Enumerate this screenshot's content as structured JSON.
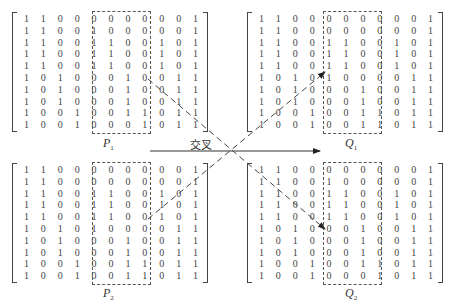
{
  "diagram": {
    "crossover_label": "交叉",
    "matrices": [
      {
        "id": "P1",
        "label": "P",
        "sub": "1",
        "rows": [
          [
            1,
            1,
            0,
            0,
            0,
            0,
            0,
            0,
            0,
            0,
            1
          ],
          [
            1,
            1,
            0,
            0,
            1,
            0,
            0,
            0,
            0,
            0,
            1
          ],
          [
            1,
            1,
            0,
            0,
            1,
            1,
            0,
            0,
            1,
            0,
            1
          ],
          [
            1,
            1,
            0,
            0,
            1,
            1,
            0,
            0,
            1,
            0,
            1
          ],
          [
            1,
            1,
            0,
            0,
            1,
            1,
            0,
            0,
            1,
            0,
            1
          ],
          [
            1,
            0,
            1,
            0,
            0,
            0,
            1,
            0,
            0,
            1,
            1
          ],
          [
            1,
            0,
            1,
            0,
            0,
            0,
            1,
            0,
            0,
            1,
            1
          ],
          [
            1,
            0,
            1,
            0,
            0,
            0,
            1,
            0,
            0,
            1,
            1
          ],
          [
            1,
            0,
            0,
            1,
            0,
            0,
            1,
            1,
            0,
            1,
            1
          ],
          [
            1,
            0,
            0,
            1,
            0,
            0,
            0,
            1,
            0,
            1,
            1
          ]
        ]
      },
      {
        "id": "Q1",
        "label": "Q",
        "sub": "1",
        "rows": [
          [
            1,
            1,
            0,
            0,
            0,
            0,
            0,
            0,
            0,
            0,
            1
          ],
          [
            1,
            1,
            0,
            0,
            0,
            0,
            0,
            0,
            0,
            0,
            1
          ],
          [
            1,
            1,
            0,
            0,
            1,
            1,
            0,
            0,
            1,
            0,
            1
          ],
          [
            1,
            1,
            0,
            0,
            1,
            1,
            0,
            0,
            1,
            0,
            1
          ],
          [
            1,
            1,
            0,
            0,
            1,
            1,
            0,
            0,
            1,
            0,
            1
          ],
          [
            1,
            0,
            1,
            0,
            1,
            0,
            0,
            0,
            0,
            1,
            1
          ],
          [
            1,
            0,
            1,
            0,
            0,
            0,
            1,
            0,
            0,
            1,
            1
          ],
          [
            1,
            0,
            1,
            0,
            0,
            0,
            1,
            0,
            0,
            1,
            1
          ],
          [
            1,
            0,
            0,
            1,
            0,
            0,
            1,
            1,
            0,
            1,
            1
          ],
          [
            1,
            0,
            0,
            1,
            0,
            0,
            1,
            1,
            0,
            1,
            1
          ]
        ]
      },
      {
        "id": "P2",
        "label": "P",
        "sub": "2",
        "rows": [
          [
            1,
            1,
            0,
            0,
            0,
            0,
            0,
            0,
            0,
            0,
            1
          ],
          [
            1,
            1,
            0,
            0,
            0,
            0,
            0,
            0,
            0,
            0,
            1
          ],
          [
            1,
            1,
            0,
            0,
            1,
            1,
            0,
            0,
            1,
            0,
            1
          ],
          [
            1,
            1,
            0,
            0,
            1,
            1,
            0,
            0,
            1,
            0,
            1
          ],
          [
            1,
            1,
            0,
            0,
            1,
            1,
            0,
            0,
            1,
            0,
            1
          ],
          [
            1,
            0,
            1,
            0,
            1,
            0,
            0,
            0,
            0,
            1,
            1
          ],
          [
            1,
            0,
            1,
            0,
            0,
            0,
            1,
            0,
            0,
            1,
            1
          ],
          [
            1,
            0,
            1,
            0,
            0,
            0,
            1,
            0,
            0,
            1,
            1
          ],
          [
            1,
            0,
            0,
            1,
            0,
            0,
            1,
            1,
            0,
            1,
            1
          ],
          [
            1,
            0,
            0,
            1,
            0,
            0,
            1,
            1,
            0,
            1,
            1
          ]
        ]
      },
      {
        "id": "Q2",
        "label": "Q",
        "sub": "2",
        "rows": [
          [
            1,
            1,
            0,
            0,
            0,
            0,
            0,
            0,
            0,
            0,
            1
          ],
          [
            1,
            1,
            0,
            0,
            1,
            0,
            0,
            0,
            0,
            0,
            1
          ],
          [
            1,
            1,
            0,
            0,
            1,
            1,
            0,
            0,
            1,
            0,
            1
          ],
          [
            1,
            1,
            0,
            0,
            1,
            1,
            0,
            0,
            1,
            0,
            1
          ],
          [
            1,
            1,
            0,
            0,
            1,
            1,
            0,
            0,
            1,
            0,
            1
          ],
          [
            1,
            0,
            1,
            0,
            0,
            0,
            1,
            0,
            0,
            1,
            1
          ],
          [
            1,
            0,
            1,
            0,
            0,
            0,
            1,
            0,
            0,
            1,
            1
          ],
          [
            1,
            0,
            1,
            0,
            0,
            0,
            1,
            0,
            0,
            1,
            1
          ],
          [
            1,
            0,
            0,
            1,
            0,
            0,
            1,
            1,
            0,
            1,
            1
          ],
          [
            1,
            0,
            0,
            1,
            0,
            0,
            0,
            1,
            0,
            1,
            1
          ]
        ]
      }
    ],
    "crossover_columns": [
      4,
      5,
      6
    ]
  }
}
